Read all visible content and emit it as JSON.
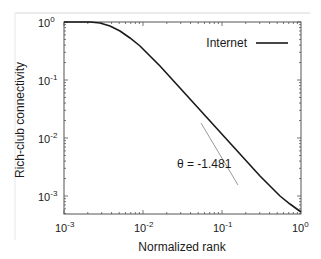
{
  "chart_data": {
    "type": "line",
    "title": "",
    "xlabel": "Normalized rank",
    "ylabel": "Rich-club connectivity",
    "xscale": "log",
    "yscale": "log",
    "xlim": [
      0.001,
      1
    ],
    "ylim": [
      0.0005,
      1
    ],
    "xticks": [
      {
        "base": "10",
        "exp": "-3",
        "value": 0.001
      },
      {
        "base": "10",
        "exp": "-2",
        "value": 0.01
      },
      {
        "base": "10",
        "exp": "-1",
        "value": 0.1
      },
      {
        "base": "10",
        "exp": "0",
        "value": 1
      }
    ],
    "yticks": [
      {
        "base": "10",
        "exp": "0",
        "value": 1
      },
      {
        "base": "10",
        "exp": "-1",
        "value": 0.1
      },
      {
        "base": "10",
        "exp": "-2",
        "value": 0.01
      },
      {
        "base": "10",
        "exp": "-3",
        "value": 0.001
      }
    ],
    "grid": false,
    "legend": {
      "position": "upper right",
      "entries": [
        "Internet"
      ]
    },
    "series": [
      {
        "name": "Internet",
        "color": "#1a1a1a",
        "x": [
          0.001,
          0.002,
          0.003,
          0.005,
          0.007,
          0.01,
          0.015,
          0.02,
          0.03,
          0.05,
          0.1,
          0.2,
          0.3,
          0.5,
          1.0
        ],
        "y": [
          1.0,
          1.0,
          0.98,
          0.9,
          0.75,
          0.55,
          0.32,
          0.2,
          0.1,
          0.045,
          0.016,
          0.0058,
          0.0032,
          0.0015,
          0.00055
        ]
      }
    ],
    "annotations": [
      {
        "text": "θ = -1.481",
        "x": 0.04,
        "y": 0.0028
      },
      {
        "type": "reference-slope-line",
        "color": "#9a9a9a",
        "x": [
          0.06,
          0.3
        ],
        "y": [
          0.02,
          0.0017
        ]
      }
    ]
  },
  "labels": {
    "xlabel": "Normalized rank",
    "ylabel": "Rich-club connectivity",
    "legend_label": "Internet",
    "annotation": "θ = -1.481",
    "tick_base": "10",
    "xtick_exp": [
      "-3",
      "-2",
      "-1",
      "0"
    ],
    "ytick_exp": [
      "0",
      "-1",
      "-2",
      "-3"
    ]
  },
  "colors": {
    "series": "#1a1a1a",
    "reference_line": "#9a9a9a",
    "frame": "#555555"
  }
}
